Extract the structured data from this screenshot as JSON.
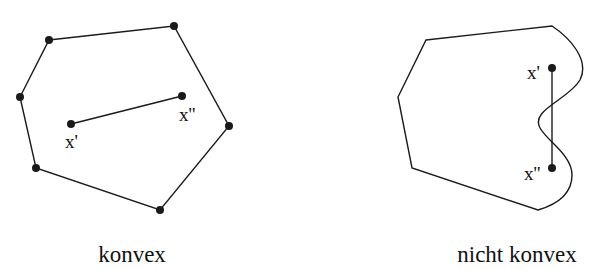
{
  "left_figure": {
    "caption": "konvex",
    "point_a_label": "x'",
    "point_b_label": "x''"
  },
  "right_figure": {
    "caption": "nicht konvex",
    "point_a_label": "x'",
    "point_b_label": "x''"
  },
  "colors": {
    "stroke": "#1a1a1a",
    "background": "#ffffff"
  }
}
